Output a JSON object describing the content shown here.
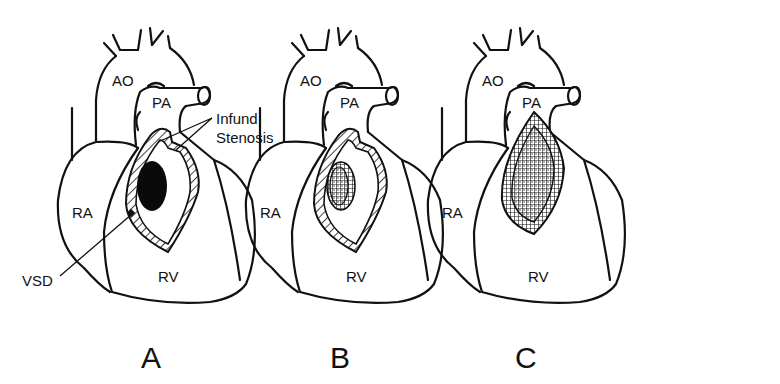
{
  "figure": {
    "type": "anatomical-line-diagram",
    "panels": [
      {
        "id": "A",
        "label": "A",
        "structures": {
          "aorta": "AO",
          "pulmonary_artery": "PA",
          "right_atrium": "RA",
          "right_ventricle": "RV"
        },
        "annotations": {
          "infund_line1": "Infund.",
          "infund_line2": "Stenosis",
          "vsd": "VSD"
        },
        "defect": "VSD shown solid black; hatched infundibular muscle"
      },
      {
        "id": "B",
        "label": "B",
        "structures": {
          "aorta": "AO",
          "pulmonary_artery": "PA",
          "right_atrium": "RA",
          "right_ventricle": "RV"
        },
        "defect": "VSD closed with stippled patch"
      },
      {
        "id": "C",
        "label": "C",
        "structures": {
          "aorta": "AO",
          "pulmonary_artery": "PA",
          "right_atrium": "RA",
          "right_ventricle": "RV"
        },
        "defect": "outflow tract patch (stippled) with cross-hatched border"
      }
    ]
  },
  "colors": {
    "ink": "#111111",
    "background": "#ffffff",
    "vsd_fill": "#0a0a0a"
  }
}
